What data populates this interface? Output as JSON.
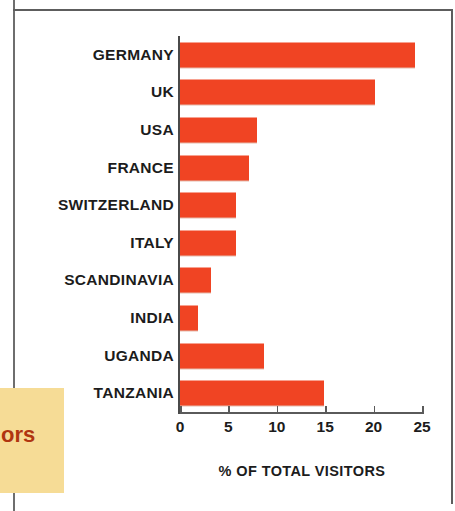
{
  "page": {
    "background_color": "#ffffff",
    "frame_color": "#5d5d5d"
  },
  "callout": {
    "background_color": "#f6dc96",
    "text_color": "#b03510",
    "text": "ors"
  },
  "chart_data": {
    "type": "bar",
    "orientation": "horizontal",
    "title": "",
    "subtitle": "",
    "xlabel": "% OF TOTAL VISITORS",
    "ylabel": "",
    "xlim": [
      0,
      25
    ],
    "xticks": [
      0,
      5,
      10,
      15,
      20,
      25
    ],
    "xtick_labels": [
      "0",
      "5",
      "10",
      "15",
      "20",
      "25"
    ],
    "grid": false,
    "legend": null,
    "bar_color": "#f04423",
    "categories": [
      "GERMANY",
      "UK",
      "USA",
      "FRANCE",
      "SWITZERLAND",
      "ITALY",
      "SCANDINAVIA",
      "INDIA",
      "UGANDA",
      "TANZANIA"
    ],
    "values": [
      24.3,
      20.1,
      8.0,
      7.1,
      5.8,
      5.8,
      3.2,
      1.9,
      8.7,
      14.9
    ]
  }
}
